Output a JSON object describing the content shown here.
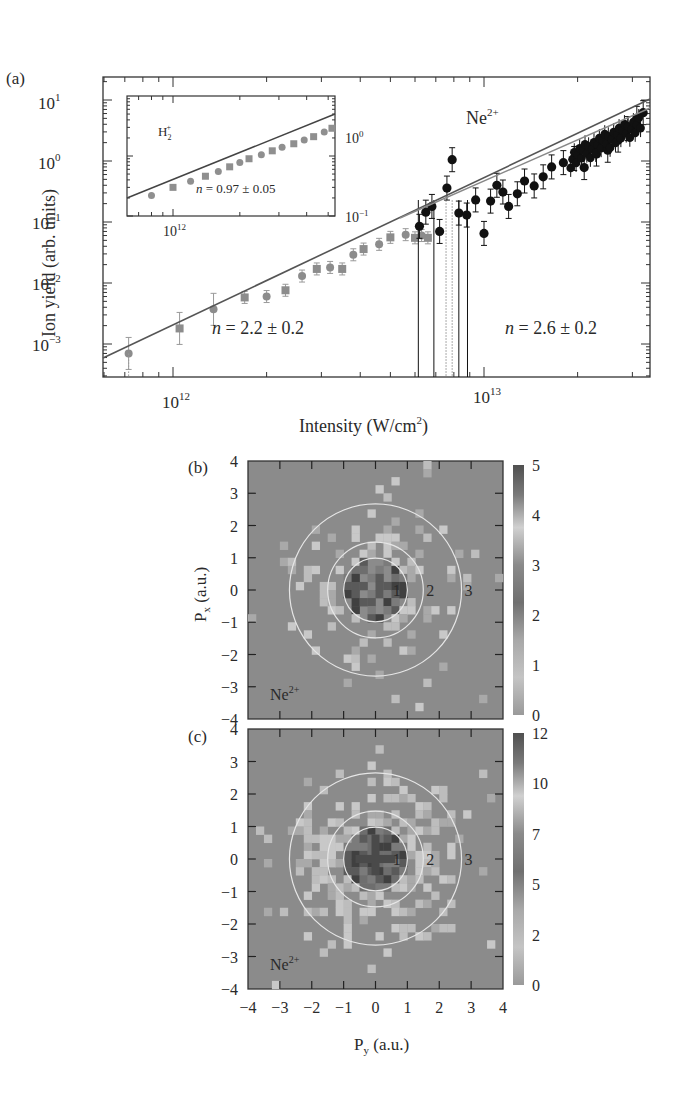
{
  "chart_data": [
    {
      "panel": "(a)",
      "type": "scatter",
      "title": "",
      "xlabel": "Intensity (W/cm²)",
      "ylabel": "Ion yield (arb. units)",
      "xscale": "log",
      "yscale": "log",
      "xlim": [
        620000000000.0,
        33000000000000.0
      ],
      "ylim": [
        0.00035,
        30
      ],
      "x_ticks": [
        "10^12",
        "10^13"
      ],
      "y_ticks": [
        "10^-3",
        "10^-2",
        "10^-1",
        "10^0",
        "10^1"
      ],
      "annotations": [
        "Ne²⁺",
        "n = 2.2 ± 0.2",
        "n = 2.6 ± 0.2"
      ],
      "series": [
        {
          "name": "Ne2+ (low intensity, gray)",
          "color": "#8c8c8c",
          "x": [
            720000000000.0,
            1050000000000.0,
            1350000000000.0,
            1700000000000.0,
            2000000000000.0,
            2300000000000.0,
            2600000000000.0,
            2900000000000.0,
            3200000000000.0,
            3500000000000.0,
            3800000000000.0,
            4100000000000.0,
            4600000000000.0,
            5000000000000.0,
            5600000000000.0,
            6000000000000.0,
            6300000000000.0,
            6600000000000.0
          ],
          "y": [
            0.0007,
            0.0018,
            0.0037,
            0.0058,
            0.006,
            0.0076,
            0.013,
            0.017,
            0.018,
            0.017,
            0.029,
            0.036,
            0.043,
            0.056,
            0.062,
            0.055,
            0.06,
            0.055
          ]
        },
        {
          "name": "Ne2+ (high intensity, black)",
          "color": "#111111",
          "x": [
            6200000000000.0,
            6500000000000.0,
            6800000000000.0,
            7200000000000.0,
            7600000000000.0,
            7900000000000.0,
            8300000000000.0,
            8800000000000.0,
            9400000000000.0,
            10000000000000.0,
            10500000000000.0,
            11000000000000.0,
            11500000000000.0,
            12000000000000.0,
            12800000000000.0,
            13500000000000.0,
            14500000000000.0,
            15500000000000.0,
            16500000000000.0,
            18000000000000.0,
            19500000000000.0,
            21000000000000.0,
            23000000000000.0,
            25000000000000.0,
            27000000000000.0,
            29000000000000.0,
            31000000000000.0,
            32500000000000.0
          ],
          "y": [
            0.085,
            0.145,
            0.18,
            0.07,
            0.36,
            1.05,
            0.14,
            0.13,
            0.23,
            0.065,
            0.22,
            0.4,
            0.31,
            0.18,
            0.29,
            0.47,
            0.39,
            0.55,
            0.8,
            0.94,
            1.1,
            0.78,
            1.3,
            1.5,
            2.2,
            3.4,
            5.0,
            6.2
          ]
        }
      ],
      "fits": [
        {
          "label": "n = 2.2 ± 0.2",
          "slope": 2.2
        },
        {
          "label": "n = 2.6 ± 0.2",
          "slope": 2.6
        }
      ],
      "inset": {
        "type": "scatter",
        "xscale": "log",
        "yscale": "log",
        "label": "H₂⁺",
        "annotation": "n = 0.97 ± 0.05",
        "x_ticks": [
          "10^12"
        ],
        "y_ticks": [
          "10^-1",
          "10^0"
        ],
        "x": [
          800000000000.0,
          1000000000000.0,
          1200000000000.0,
          1400000000000.0,
          1600000000000.0,
          1800000000000.0,
          2000000000000.0,
          2200000000000.0,
          2500000000000.0,
          2800000000000.0,
          3100000000000.0,
          3500000000000.0,
          3900000000000.0,
          4300000000000.0,
          4800000000000.0,
          5200000000000.0,
          5600000000000.0,
          5900000000000.0
        ],
        "y": [
          0.22,
          0.3,
          0.38,
          0.46,
          0.55,
          0.66,
          0.78,
          0.9,
          1.05,
          1.22,
          1.4,
          1.6,
          1.85,
          2.1,
          2.5,
          2.9,
          4.5,
          3.2
        ]
      }
    },
    {
      "panel": "(b)",
      "type": "heatmap",
      "label": "Ne²⁺",
      "xlabel": "P_y (a.u.)",
      "ylabel": "P_x (a.u.)",
      "xlim": [
        -4,
        4
      ],
      "ylim": [
        -4,
        4
      ],
      "ticks": [
        "-4",
        "-3",
        "-2",
        "-1",
        "0",
        "1",
        "2",
        "3",
        "4"
      ],
      "circle_radii": [
        1,
        1.5,
        2.7
      ],
      "circle_labels": [
        "1",
        "2",
        "3"
      ],
      "colorbar": {
        "min": 0,
        "max": 5,
        "ticks": [
          "0",
          "1",
          "2",
          "3",
          "4",
          "5"
        ]
      }
    },
    {
      "panel": "(c)",
      "type": "heatmap",
      "label": "Ne²⁺",
      "xlabel": "P_y (a.u.)",
      "ylabel": "",
      "xlim": [
        -4,
        4
      ],
      "ylim": [
        -4,
        4
      ],
      "ticks": [
        "-4",
        "-3",
        "-2",
        "-1",
        "0",
        "1",
        "2",
        "3",
        "4"
      ],
      "circle_radii": [
        1,
        1.5,
        2.7
      ],
      "circle_labels": [
        "1",
        "2",
        "3"
      ],
      "colorbar": {
        "min": 0,
        "max": 12,
        "ticks": [
          "0",
          "2",
          "5",
          "7",
          "10",
          "12"
        ]
      }
    }
  ],
  "labels": {
    "panel_a": "(a)",
    "panel_b": "(b)",
    "panel_c": "(c)",
    "ylabel_a": "Ion yield (arb. units)",
    "xlabel_a_main": "Intensity (W/cm",
    "xlabel_a_sup": "2",
    "xlabel_a_end": ")",
    "ne_main": "Ne",
    "ne_sup": "2+",
    "fit_low": "= 2.2 ± 0.2",
    "fit_high": "= 2.6 ± 0.2",
    "fit_inset": "= 0.97 ± 0.05",
    "n": "n",
    "h2_base": "H",
    "h2_sub": "2",
    "h2_sup": "+",
    "px_label": "P",
    "px_sub": "x",
    "py_label": "P",
    "py_sub": "y",
    "au": "(a.u.)"
  }
}
